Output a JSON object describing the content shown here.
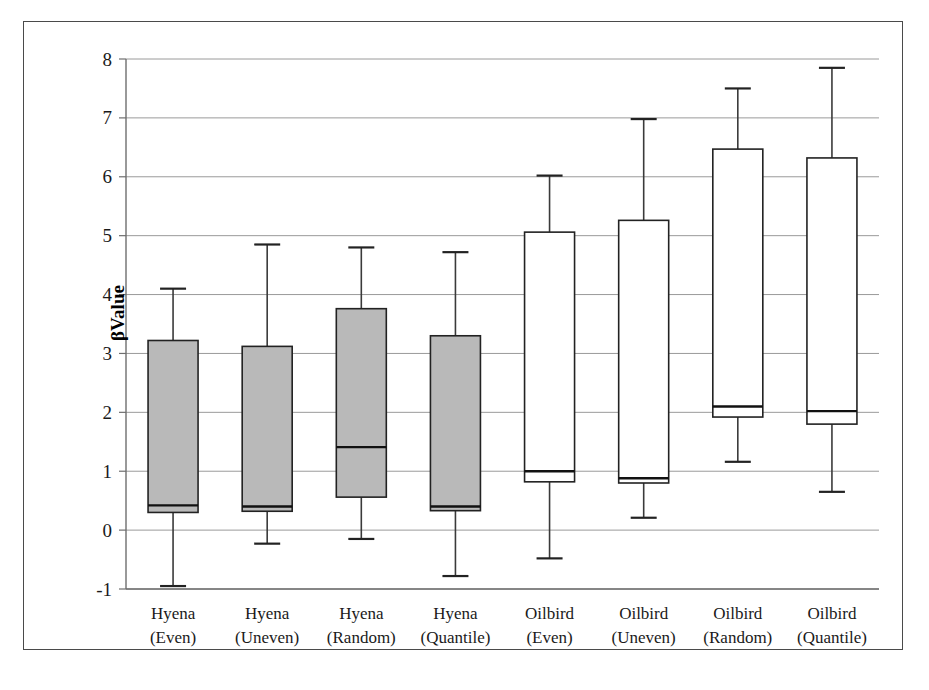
{
  "figure": {
    "background_color": "#ffffff",
    "frame_color": "#4a4a4a",
    "box_fill_group_a": "#b9b9b9",
    "box_fill_group_b": "#ffffff",
    "line_color": "#222222",
    "gridline_color": "#9a9a9a"
  },
  "chart_data": {
    "type": "box",
    "title": "",
    "xlabel": "",
    "ylabel": "βValue",
    "ylim": [
      -1,
      8
    ],
    "ytick_labels": [
      "8",
      "7",
      "6",
      "5",
      "4",
      "3",
      "2",
      "1",
      "0",
      "-1"
    ],
    "ytick_values": [
      8,
      7,
      6,
      5,
      4,
      3,
      2,
      1,
      0,
      -1
    ],
    "grid": true,
    "legend": "none",
    "categories": [
      "Hyena (Even)",
      "Hyena (Uneven)",
      "Hyena (Random)",
      "Hyena (Quantile)",
      "Oilbird (Even)",
      "Oilbird (Uneven)",
      "Oilbird (Random)",
      "Oilbird (Quantile)"
    ],
    "category_lines": [
      [
        "Hyena",
        "(Even)"
      ],
      [
        "Hyena",
        "(Uneven)"
      ],
      [
        "Hyena",
        "(Random)"
      ],
      [
        "Hyena",
        "(Quantile)"
      ],
      [
        "Oilbird",
        "(Even)"
      ],
      [
        "Oilbird",
        "(Uneven)"
      ],
      [
        "Oilbird",
        "(Random)"
      ],
      [
        "Oilbird",
        "(Quantile)"
      ]
    ],
    "boxes": [
      {
        "label": "Hyena (Even)",
        "whisker_low": -0.95,
        "q1": 0.3,
        "median": 0.42,
        "q3": 3.22,
        "whisker_high": 4.1,
        "fill": "gray"
      },
      {
        "label": "Hyena (Uneven)",
        "whisker_low": -0.23,
        "q1": 0.32,
        "median": 0.4,
        "q3": 3.12,
        "whisker_high": 4.85,
        "fill": "gray"
      },
      {
        "label": "Hyena (Random)",
        "whisker_low": -0.15,
        "q1": 0.56,
        "median": 1.41,
        "q3": 3.76,
        "whisker_high": 4.8,
        "fill": "gray"
      },
      {
        "label": "Hyena (Quantile)",
        "whisker_low": -0.78,
        "q1": 0.33,
        "median": 0.4,
        "q3": 3.3,
        "whisker_high": 4.72,
        "fill": "gray"
      },
      {
        "label": "Oilbird (Even)",
        "whisker_low": -0.48,
        "q1": 0.82,
        "median": 1.0,
        "q3": 5.06,
        "whisker_high": 6.02,
        "fill": "white"
      },
      {
        "label": "Oilbird (Uneven)",
        "whisker_low": 0.21,
        "q1": 0.8,
        "median": 0.88,
        "q3": 5.26,
        "whisker_high": 6.98,
        "fill": "white"
      },
      {
        "label": "Oilbird (Random)",
        "whisker_low": 1.16,
        "q1": 1.92,
        "median": 2.1,
        "q3": 6.47,
        "whisker_high": 7.5,
        "fill": "white"
      },
      {
        "label": "Oilbird (Quantile)",
        "whisker_low": 0.65,
        "q1": 1.8,
        "median": 2.02,
        "q3": 6.32,
        "whisker_high": 7.85,
        "fill": "white"
      }
    ]
  }
}
